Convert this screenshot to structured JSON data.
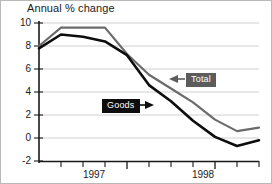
{
  "chart_data": {
    "type": "line",
    "title": "Annual % change",
    "xlabel": "",
    "ylabel": "",
    "ylim": [
      -2,
      10
    ],
    "yticks": [
      -2,
      0,
      2,
      4,
      6,
      8,
      10
    ],
    "ytick_labels": [
      "-2",
      "0",
      "2",
      "4",
      "6",
      "8",
      "10"
    ],
    "xlim": [
      0,
      10
    ],
    "xticks": [
      1,
      2,
      3,
      4,
      5,
      6,
      7,
      8,
      9
    ],
    "xtick_labels": [
      "1997",
      "1998"
    ],
    "xtick_label_positions": [
      2.5,
      6.5
    ],
    "grid": true,
    "legend_position": "inline-callouts",
    "series": [
      {
        "name": "Total",
        "color": "#6b6b6b",
        "x": [
          0,
          1,
          2,
          3,
          4,
          5,
          6,
          7,
          8,
          9,
          10
        ],
        "values": [
          8.0,
          9.6,
          9.6,
          9.6,
          7.3,
          5.5,
          4.3,
          3.1,
          1.6,
          0.6,
          0.9
        ]
      },
      {
        "name": "Goods",
        "color": "#0d0d0d",
        "x": [
          0,
          1,
          2,
          3,
          4,
          5,
          6,
          7,
          8,
          9,
          10
        ],
        "values": [
          7.8,
          9.0,
          8.8,
          8.4,
          7.2,
          4.6,
          3.2,
          1.5,
          0.1,
          -0.7,
          -0.2
        ]
      }
    ],
    "annotations": [
      {
        "name": "Total",
        "label": "Total",
        "style": "gray-box-left-arrow"
      },
      {
        "name": "Goods",
        "label": "Goods",
        "style": "black-box-right-arrow"
      }
    ]
  },
  "axis": {
    "y_labels": [
      "10",
      "8",
      "6",
      "4",
      "2",
      "0",
      "-2"
    ],
    "x_labels": [
      "1997",
      "1998"
    ]
  },
  "callouts": {
    "total": "Total",
    "goods": "Goods"
  },
  "colors": {
    "total_line": "#6b6b6b",
    "goods_line": "#0d0d0d",
    "grid": "#d0d0d0",
    "axis": "#1a1a1a",
    "background": "#ffffff",
    "frame": "#b9b9b9"
  }
}
